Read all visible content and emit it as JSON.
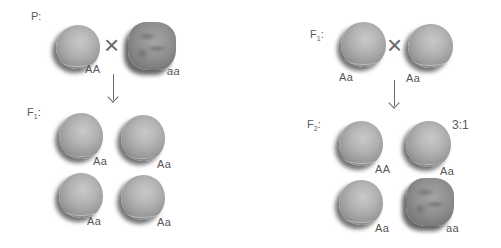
{
  "left_panel": {
    "parent_label": "P:",
    "parents": [
      {
        "genotype": "AA",
        "phenotype": "round"
      },
      {
        "genotype": "aa",
        "phenotype": "wrinkled"
      }
    ],
    "cross_symbol": "×",
    "arrow": "↓",
    "offspring_label_base": "F",
    "offspring_label_sub": "1",
    "offspring_label_colon": ":",
    "offspring": [
      {
        "genotype": "Aa",
        "phenotype": "round"
      },
      {
        "genotype": "Aa",
        "phenotype": "round"
      },
      {
        "genotype": "Aa",
        "phenotype": "round"
      },
      {
        "genotype": "Aa",
        "phenotype": "round"
      }
    ]
  },
  "right_panel": {
    "parent_label_base": "F",
    "parent_label_sub": "1",
    "parent_label_colon": ":",
    "parents": [
      {
        "genotype": "Aa",
        "phenotype": "round"
      },
      {
        "genotype": "Aa",
        "phenotype": "round"
      }
    ],
    "cross_symbol": "×",
    "arrow": "↓",
    "offspring_label_base": "F",
    "offspring_label_sub": "2",
    "offspring_label_colon": ":",
    "ratio": "3:1",
    "offspring": [
      {
        "genotype": "AA",
        "phenotype": "round"
      },
      {
        "genotype": "Aa",
        "phenotype": "round"
      },
      {
        "genotype": "Aa",
        "phenotype": "round"
      },
      {
        "genotype": "aa",
        "phenotype": "wrinkled"
      }
    ]
  }
}
